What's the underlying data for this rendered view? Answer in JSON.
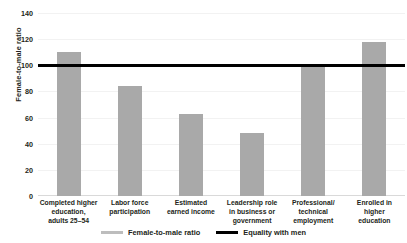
{
  "chart_data": {
    "type": "bar",
    "title": "",
    "xlabel": "",
    "ylabel": "Female-to-male ratio",
    "ylim": [
      0,
      140
    ],
    "yticks": [
      0,
      20,
      40,
      60,
      80,
      100,
      120,
      140
    ],
    "grid": true,
    "legend_position": "bottom",
    "categories": [
      "Completed higher education, adults 25–54",
      "Labor force participation",
      "Estimated earned income",
      "Leadership role in business or government",
      "Professional/ technical employment",
      "Enrolled in higher education"
    ],
    "category_lines": [
      [
        "Completed higher",
        "education,",
        "adults 25–54"
      ],
      [
        "Labor force",
        "participation"
      ],
      [
        "Estimated",
        "earned income"
      ],
      [
        "Leadership role",
        "in business or",
        "government"
      ],
      [
        "Professional/",
        "technical",
        "employment"
      ],
      [
        "Enrolled in",
        "higher",
        "education"
      ]
    ],
    "series": [
      {
        "name": "Female-to-male ratio",
        "values": [
          110,
          84,
          63,
          48,
          99,
          118
        ]
      }
    ],
    "reference_line": {
      "name": "Equality with men",
      "value": 100
    },
    "colors": {
      "bar": "#a9a9a9",
      "reference_line": "#000000",
      "gridline": "#f2f2f2",
      "text": "#231f20"
    }
  },
  "legend": {
    "items": [
      {
        "label": "Female-to-male ratio",
        "swatch": "bar-swatch"
      },
      {
        "label": "Equality with men",
        "swatch": "line-swatch"
      }
    ]
  }
}
